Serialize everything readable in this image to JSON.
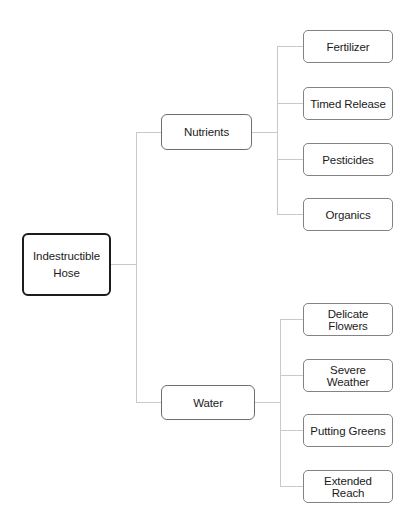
{
  "diagram": {
    "type": "tree",
    "orientation": "left-to-right",
    "background_color": "#ffffff",
    "connector_color": "#c9c9c9",
    "root": {
      "id": "root",
      "label": "Indestructible Hose",
      "label_line1": "Indestructible",
      "label_line2": "Hose",
      "border_color": "#1c1c1c"
    },
    "branches": [
      {
        "id": "nutrients",
        "label": "Nutrients",
        "border_color": "#6e6e6e",
        "children": [
          {
            "id": "fertilizer",
            "label": "Fertilizer",
            "border_color": "#838383"
          },
          {
            "id": "timed-release",
            "label": "Timed Release",
            "border_color": "#838383"
          },
          {
            "id": "pesticides",
            "label": "Pesticides",
            "border_color": "#838383"
          },
          {
            "id": "organics",
            "label": "Organics",
            "border_color": "#838383"
          }
        ]
      },
      {
        "id": "water",
        "label": "Water",
        "border_color": "#6e6e6e",
        "children": [
          {
            "id": "delicate-flowers",
            "label": "Delicate Flowers",
            "border_color": "#838383"
          },
          {
            "id": "severe-weather",
            "label": "Severe Weather",
            "border_color": "#838383"
          },
          {
            "id": "putting-greens",
            "label": "Putting Greens",
            "border_color": "#838383"
          },
          {
            "id": "extended-reach",
            "label": "Extended Reach",
            "border_color": "#838383"
          }
        ]
      }
    ]
  }
}
